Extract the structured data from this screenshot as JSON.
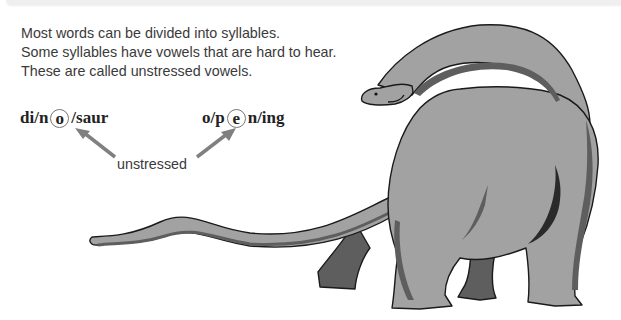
{
  "intro": {
    "lines": [
      "Most words can be divided into syllables.",
      "Some syllables have vowels that are hard to hear.",
      "These are called unstressed vowels."
    ]
  },
  "examples": [
    {
      "word": "dinosaur",
      "before": "di/n",
      "circled": "o",
      "after": "/saur"
    },
    {
      "word": "opening",
      "before": "o/p",
      "circled": "e",
      "after": "n/ing"
    }
  ],
  "annotation": {
    "label": "unstressed"
  },
  "illustration": {
    "subject": "dinosaur",
    "description": "long-necked sauropod (brontosaurus) in grey"
  },
  "colors": {
    "text": "#3a3a3a",
    "arrow": "#808080",
    "dino_body": "#a2a2a2",
    "dino_shadow": "#5e5e5e",
    "dino_outline": "#1a1a1a"
  }
}
